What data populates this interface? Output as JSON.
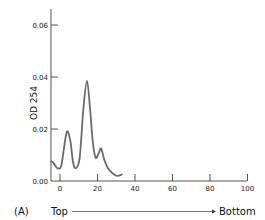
{
  "panel_label": "(A)",
  "direction": {
    "start_label": "Top",
    "end_label": "Bottom"
  },
  "colors": {
    "axis": "#555555",
    "curve": "#6b6b6b",
    "text": "#222222"
  },
  "chart_data": {
    "type": "line",
    "title": "",
    "xlabel": "",
    "ylabel": "OD 254",
    "xlim": [
      -5,
      100
    ],
    "ylim": [
      0,
      0.066
    ],
    "xticks": [
      0,
      20,
      40,
      60,
      80,
      100
    ],
    "xtick_labels": [
      "0",
      "20",
      "40",
      "60",
      "80",
      "100"
    ],
    "yticks": [
      0.0,
      0.02,
      0.04,
      0.06
    ],
    "ytick_labels": [
      "0.00",
      "0.02",
      "0.04",
      "0.06"
    ],
    "grid": false,
    "legend": null,
    "series": [
      {
        "name": "OD 254 profile",
        "x": [
          -4.8,
          -3.5,
          -1.5,
          0.5,
          2.0,
          3.7,
          5.5,
          7.0,
          8.5,
          10.5,
          12.5,
          14.4,
          16.0,
          17.5,
          19.0,
          20.5,
          21.9,
          23.5,
          25.5,
          28.0,
          30.5,
          33.0
        ],
        "y": [
          0.0075,
          0.007,
          0.005,
          0.0055,
          0.012,
          0.019,
          0.0155,
          0.007,
          0.005,
          0.009,
          0.028,
          0.0385,
          0.028,
          0.015,
          0.009,
          0.0105,
          0.0125,
          0.0085,
          0.005,
          0.003,
          0.002,
          0.0025
        ]
      }
    ],
    "annotations": [
      "(A)",
      "Top → Bottom"
    ]
  }
}
